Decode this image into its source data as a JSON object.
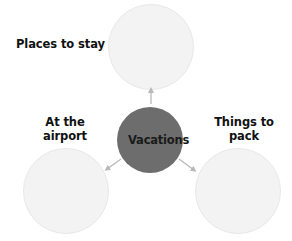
{
  "diagram": {
    "type": "mind-map",
    "center": {
      "label": "Vacations",
      "fill": "#6d6d6d"
    },
    "branches": [
      {
        "id": "top",
        "label_line1": "Places to stay",
        "label_line2": "",
        "fill": "#f3f3f3"
      },
      {
        "id": "left",
        "label_line1": "At the",
        "label_line2": "airport",
        "fill": "#f3f3f3"
      },
      {
        "id": "right",
        "label_line1": "Things to",
        "label_line2": "pack",
        "fill": "#f3f3f3"
      }
    ],
    "arrow_color": "#b8b8b8"
  }
}
